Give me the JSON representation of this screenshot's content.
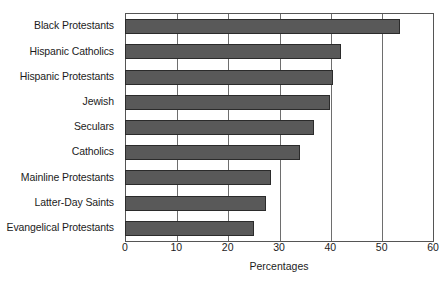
{
  "chart_data": {
    "type": "bar",
    "orientation": "horizontal",
    "title": "",
    "subtitle": "",
    "xlabel": "Percentages",
    "ylabel": "",
    "xlim": [
      0,
      60
    ],
    "xticks": [
      0,
      10,
      20,
      30,
      40,
      50,
      60
    ],
    "xtick_labels": [
      "0",
      "10",
      "20",
      "30",
      "40",
      "50",
      "60"
    ],
    "grid": "vertical",
    "legend": null,
    "categories": [
      "Black Protestants",
      "Hispanic Catholics",
      "Hispanic Protestants",
      "Jewish",
      "Seculars",
      "Catholics",
      "Mainline Protestants",
      "Latter-Day Saints",
      "Evangelical Protestants"
    ],
    "values": [
      53.5,
      42.0,
      40.5,
      39.8,
      36.8,
      34.0,
      28.4,
      27.4,
      25.0
    ],
    "bar_color": "#595959",
    "bar_border_color": "#2b2b2b",
    "axis_color": "#555555",
    "gridline_color": "#6e6e6e",
    "background_color": "#ffffff",
    "text_color": "#1c1c1c"
  }
}
